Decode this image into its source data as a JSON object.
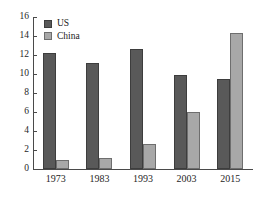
{
  "chart_data": {
    "type": "bar",
    "title": "",
    "subtitle": "",
    "xlabel": "",
    "ylabel": "",
    "categories": [
      "1973",
      "1983",
      "1993",
      "2003",
      "2015"
    ],
    "series": [
      {
        "name": "US",
        "color": "#595959",
        "values": [
          12.2,
          11.2,
          12.6,
          9.9,
          9.5
        ]
      },
      {
        "name": "China",
        "color": "#a8a8a8",
        "values": [
          1.0,
          1.2,
          2.6,
          6.0,
          14.3
        ]
      }
    ],
    "ylim": [
      0,
      16
    ],
    "ytick_values": [
      0,
      2,
      4,
      6,
      8,
      10,
      12,
      14,
      16
    ],
    "ytick_labels": [
      "0",
      "2",
      "4",
      "6",
      "8",
      "10",
      "12",
      "14",
      "16"
    ],
    "grid": false,
    "legend_position": "top-left",
    "annotations": []
  },
  "legend": {
    "entries": [
      {
        "label": "US"
      },
      {
        "label": "China"
      }
    ]
  },
  "colors": {
    "series_us": "#595959",
    "series_china": "#a8a8a8",
    "axis": "#4a4a4a",
    "background": "#ffffff",
    "text": "#1a1a1a"
  }
}
